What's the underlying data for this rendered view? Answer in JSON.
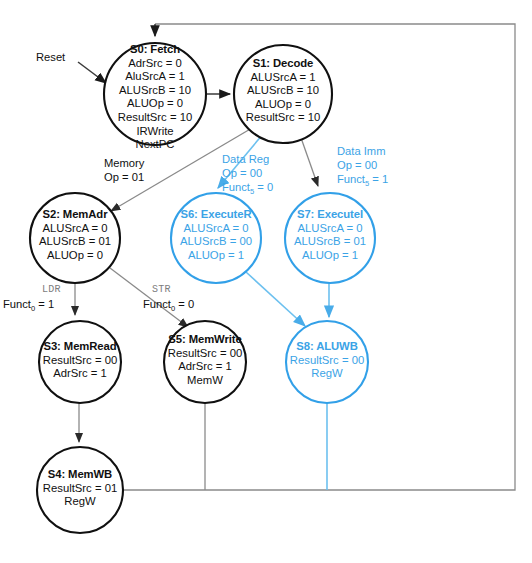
{
  "diagram": {
    "colors": {
      "black_state": "#101010",
      "blue_state": "#3ba3e6",
      "edge_gray": "#3a3a3a",
      "edge_blue": "#6cc0ef",
      "label_gray": "#7d7d7d",
      "background": "#ffffff"
    }
  },
  "states": {
    "s0": {
      "title": "S0: Fetch",
      "lines": [
        "AdrSrc = 0",
        "AluSrcA = 1",
        "ALUSrcB = 10",
        "ALUOp = 0",
        "ResultSrc = 10",
        "IRWrite",
        "NextPC"
      ],
      "color": "black"
    },
    "s1": {
      "title": "S1: Decode",
      "lines": [
        "ALUSrcA = 1",
        "ALUSrcB = 10",
        "ALUOp = 0",
        "ResultSrc = 10"
      ],
      "color": "black"
    },
    "s2": {
      "title": "S2: MemAdr",
      "lines": [
        "ALUSrcA = 0",
        "ALUSrcB = 01",
        "ALUOp = 0"
      ],
      "color": "black"
    },
    "s3": {
      "title": "S3: MemRead",
      "lines": [
        "ResultSrc = 00",
        "AdrSrc = 1"
      ],
      "color": "black"
    },
    "s4": {
      "title": "S4: MemWB",
      "lines": [
        "ResultSrc = 01",
        "RegW"
      ],
      "color": "black"
    },
    "s5": {
      "title": "S5: MemWrite",
      "lines": [
        "ResultSrc = 00",
        "AdrSrc = 1",
        "MemW"
      ],
      "color": "black"
    },
    "s6": {
      "title": "S6: ExecuteR",
      "lines": [
        "ALUSrcA = 0",
        "ALUSrcB = 00",
        "ALUOp = 1"
      ],
      "color": "blue"
    },
    "s7": {
      "title": "S7: ExecuteI",
      "lines": [
        "ALUSrcA = 0",
        "ALUSrcB = 01",
        "ALUOp = 1"
      ],
      "color": "blue"
    },
    "s8": {
      "title": "S8: ALUWB",
      "lines": [
        "ResultSrc = 00",
        "RegW"
      ],
      "color": "blue"
    }
  },
  "transitions": {
    "reset": {
      "label": "Reset",
      "color": "black"
    },
    "memory": {
      "line1": "Memory",
      "line2": "Op = 01",
      "color": "black"
    },
    "data_reg": {
      "line1": "Data Reg",
      "line2": "Op = 00",
      "line3_pre": "Funct",
      "line3_sub": "5",
      "line3_post": " = 0",
      "color": "blue"
    },
    "data_imm": {
      "line1": "Data Imm",
      "line2": "Op = 00",
      "line3_pre": "Funct",
      "line3_sub": "5",
      "line3_post": " = 1",
      "color": "blue"
    },
    "ldr": {
      "tag": "LDR",
      "cond_pre": "Funct",
      "cond_sub": "0",
      "cond_post": " = 1",
      "color": "black"
    },
    "str": {
      "tag": "STR",
      "cond_pre": "Funct",
      "cond_sub": "0",
      "cond_post": " = 0",
      "color": "black"
    }
  }
}
